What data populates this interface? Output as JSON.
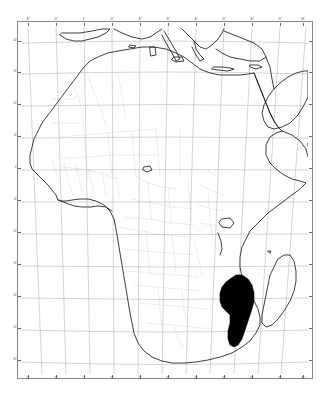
{
  "figure": {
    "type": "map",
    "projection": "conic",
    "region": "Africa",
    "highlighted_country": "Mozambique",
    "highlight_color": "#000000",
    "coastline_color": "#1a1a1a",
    "border_color": "#9a9a9a",
    "graticule_color": "#9a9a9a",
    "frame_color": "#8a8a8a",
    "background_color": "#ffffff"
  },
  "axes": {
    "lon_ticks": [
      {
        "label": "20°",
        "x": 6
      },
      {
        "label": "10°",
        "x": 34
      },
      {
        "label": "0°",
        "x": 62
      },
      {
        "label": "10°",
        "x": 90
      },
      {
        "label": "20°",
        "x": 118
      },
      {
        "label": "30°",
        "x": 146
      },
      {
        "label": "40°",
        "x": 174
      },
      {
        "label": "50°",
        "x": 202
      },
      {
        "label": "60°",
        "x": 230
      },
      {
        "label": "70°",
        "x": 258
      },
      {
        "label": "80°",
        "x": 281
      }
    ],
    "lat_ticks": [
      {
        "label": "40°",
        "y": 14
      },
      {
        "label": "30°",
        "y": 45
      },
      {
        "label": "20°",
        "y": 77
      },
      {
        "label": "10°",
        "y": 109
      },
      {
        "label": "0°",
        "y": 141
      },
      {
        "label": "10°",
        "y": 173
      },
      {
        "label": "20°",
        "y": 205
      },
      {
        "label": "30°",
        "y": 237
      },
      {
        "label": "40°",
        "y": 269
      },
      {
        "label": "50°",
        "y": 301
      },
      {
        "label": "60°",
        "y": 333
      }
    ]
  },
  "chart_data": {
    "type": "map",
    "highlight": {
      "name": "Mozambique",
      "fill": "#000000"
    },
    "features": [
      "african-mainland-coastline",
      "madagascar",
      "arabian-peninsula",
      "southern-europe",
      "mediterranean-islands",
      "country-borders",
      "graticule"
    ]
  }
}
